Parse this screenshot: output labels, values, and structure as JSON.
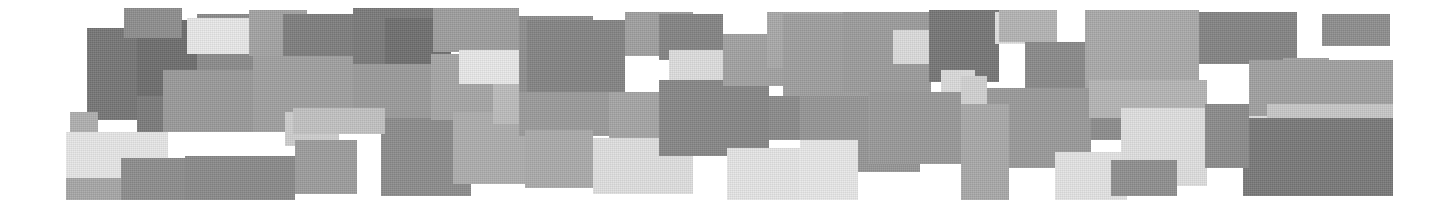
{
  "image": {
    "title": "Abstract grayscale rectangle mosaic",
    "width": 1452,
    "height": 208,
    "background_color": "#ffffff",
    "description": "Horizontal band of overlapping axis-aligned rectangles in shades of gray on a white background, resembling a low-resolution mosaic or pixelated redaction pattern.",
    "palette": {
      "white": "#ffffff",
      "near_white": "#efefef",
      "very_light_gray": "#e3e3e3",
      "light_gray": "#d2d2d2",
      "mid_light_gray": "#bdbdbd",
      "mid_gray": "#a8a8a8",
      "mid_dark_gray": "#969696",
      "dark_gray": "#858585",
      "darker_gray": "#767676",
      "darkest_gray": "#6a6a6a"
    }
  },
  "tiles": [
    {
      "name": "tile-r1-c1-dark",
      "x": 87,
      "y": 28,
      "w": 50,
      "h": 92,
      "color": "#767676"
    },
    {
      "name": "tile-r1-c2-dark",
      "x": 137,
      "y": 20,
      "w": 60,
      "h": 76,
      "color": "#6e6e6e"
    },
    {
      "name": "tile-r1-c3-dark",
      "x": 137,
      "y": 96,
      "w": 60,
      "h": 36,
      "color": "#7b7b7b"
    },
    {
      "name": "tile-r1-c4-mid",
      "x": 197,
      "y": 14,
      "w": 88,
      "h": 56,
      "color": "#8b8b8b"
    },
    {
      "name": "tile-r1-c5-nearwhite",
      "x": 187,
      "y": 18,
      "w": 62,
      "h": 36,
      "color": "#e9e9e9"
    },
    {
      "name": "tile-r1-c6-lightband",
      "x": 249,
      "y": 10,
      "w": 58,
      "h": 46,
      "color": "#a3a3a3"
    },
    {
      "name": "tile-r1-c7-mid",
      "x": 163,
      "y": 70,
      "w": 122,
      "h": 62,
      "color": "#9a9a9a"
    },
    {
      "name": "tile-r1-c8-light",
      "x": 70,
      "y": 112,
      "w": 28,
      "h": 34,
      "color": "#b0b0b0"
    },
    {
      "name": "tile-r1-c9-nearwhite",
      "x": 66,
      "y": 132,
      "w": 102,
      "h": 46,
      "color": "#e7e7e7"
    },
    {
      "name": "tile-r1-c10-midgray",
      "x": 66,
      "y": 178,
      "w": 102,
      "h": 22,
      "color": "#a7a7a7"
    },
    {
      "name": "tile-r1-c11-dark",
      "x": 121,
      "y": 158,
      "w": 66,
      "h": 42,
      "color": "#8d8d8d"
    },
    {
      "name": "tile-r2-c1-dark",
      "x": 124,
      "y": 8,
      "w": 58,
      "h": 30,
      "color": "#8e8e8e"
    },
    {
      "name": "tile-r2-c2-darkmid",
      "x": 283,
      "y": 14,
      "w": 72,
      "h": 62,
      "color": "#7e7e7e"
    },
    {
      "name": "tile-r2-c3-midlight",
      "x": 253,
      "y": 56,
      "w": 100,
      "h": 76,
      "color": "#a0a0a0"
    },
    {
      "name": "tile-r2-c4-light",
      "x": 285,
      "y": 112,
      "w": 54,
      "h": 34,
      "color": "#cfcfcf"
    },
    {
      "name": "tile-r2-c5-darkband",
      "x": 185,
      "y": 156,
      "w": 110,
      "h": 44,
      "color": "#8a8a8a"
    },
    {
      "name": "tile-r2-c6-midgray",
      "x": 295,
      "y": 140,
      "w": 62,
      "h": 54,
      "color": "#9d9d9d"
    },
    {
      "name": "tile-r3-c1-dark",
      "x": 353,
      "y": 8,
      "w": 80,
      "h": 56,
      "color": "#7a7a7a"
    },
    {
      "name": "tile-r3-c2-darker",
      "x": 385,
      "y": 18,
      "w": 66,
      "h": 52,
      "color": "#6f6f6f"
    },
    {
      "name": "tile-r3-c3-mid",
      "x": 353,
      "y": 64,
      "w": 78,
      "h": 56,
      "color": "#9b9b9b"
    },
    {
      "name": "tile-r3-c4-darkblock",
      "x": 381,
      "y": 118,
      "w": 90,
      "h": 78,
      "color": "#8c8c8c"
    },
    {
      "name": "tile-r3-c5-lightband",
      "x": 293,
      "y": 108,
      "w": 92,
      "h": 26,
      "color": "#c2c2c2"
    },
    {
      "name": "tile-r3-c6-midlight",
      "x": 431,
      "y": 54,
      "w": 62,
      "h": 66,
      "color": "#a6a6a6"
    },
    {
      "name": "tile-r4-c1-mid",
      "x": 433,
      "y": 8,
      "w": 86,
      "h": 44,
      "color": "#9e9e9e"
    },
    {
      "name": "tile-r4-c2-nearwhite",
      "x": 459,
      "y": 50,
      "w": 62,
      "h": 34,
      "color": "#e9e9e9"
    },
    {
      "name": "tile-r4-c3-midlight",
      "x": 453,
      "y": 112,
      "w": 74,
      "h": 72,
      "color": "#aeaeae"
    },
    {
      "name": "tile-r4-c4-light",
      "x": 493,
      "y": 84,
      "w": 44,
      "h": 40,
      "color": "#bcbcbc"
    },
    {
      "name": "tile-r5-c1-mid",
      "x": 519,
      "y": 16,
      "w": 74,
      "h": 76,
      "color": "#8f8f8f"
    },
    {
      "name": "tile-r5-c2-darkwide",
      "x": 527,
      "y": 20,
      "w": 98,
      "h": 76,
      "color": "#848484"
    },
    {
      "name": "tile-r5-c3-midband",
      "x": 519,
      "y": 92,
      "w": 118,
      "h": 44,
      "color": "#9b9b9b"
    },
    {
      "name": "tile-r5-c4-midlight",
      "x": 525,
      "y": 130,
      "w": 68,
      "h": 58,
      "color": "#ababab"
    },
    {
      "name": "tile-r5-c5-nearwhite",
      "x": 593,
      "y": 138,
      "w": 100,
      "h": 56,
      "color": "#e0e0e0"
    },
    {
      "name": "tile-r5-c6-midlight2",
      "x": 609,
      "y": 92,
      "w": 56,
      "h": 46,
      "color": "#a5a5a5"
    },
    {
      "name": "tile-r6-c1-midlight",
      "x": 625,
      "y": 12,
      "w": 68,
      "h": 44,
      "color": "#a0a0a0"
    },
    {
      "name": "tile-r6-c2-darkblock",
      "x": 659,
      "y": 14,
      "w": 64,
      "h": 46,
      "color": "#848484"
    },
    {
      "name": "tile-r6-c3-light",
      "x": 669,
      "y": 50,
      "w": 58,
      "h": 34,
      "color": "#dedede"
    },
    {
      "name": "tile-r6-c4-dark",
      "x": 659,
      "y": 80,
      "w": 110,
      "h": 76,
      "color": "#878787"
    },
    {
      "name": "tile-r6-c5-nearwhite",
      "x": 727,
      "y": 148,
      "w": 118,
      "h": 52,
      "color": "#e6e6e6"
    },
    {
      "name": "tile-r6-c6-midgray",
      "x": 723,
      "y": 34,
      "w": 60,
      "h": 52,
      "color": "#a2a2a2"
    },
    {
      "name": "tile-r7-c1-midlight",
      "x": 767,
      "y": 12,
      "w": 78,
      "h": 56,
      "color": "#a9a9a9"
    },
    {
      "name": "tile-r7-c2-midlight2",
      "x": 783,
      "y": 14,
      "w": 92,
      "h": 84,
      "color": "#9f9f9f"
    },
    {
      "name": "tile-r7-c3-dark",
      "x": 769,
      "y": 96,
      "w": 74,
      "h": 44,
      "color": "#8b8b8b"
    },
    {
      "name": "tile-r7-c4-midwide",
      "x": 800,
      "y": 96,
      "w": 120,
      "h": 76,
      "color": "#969696"
    },
    {
      "name": "tile-r7-c5-nearwhite",
      "x": 800,
      "y": 140,
      "w": 58,
      "h": 60,
      "color": "#e8e8e8"
    },
    {
      "name": "tile-r8-c1-mid",
      "x": 843,
      "y": 12,
      "w": 88,
      "h": 80,
      "color": "#9c9c9c"
    },
    {
      "name": "tile-r8-c2-light",
      "x": 893,
      "y": 30,
      "w": 62,
      "h": 34,
      "color": "#dcdcdc"
    },
    {
      "name": "tile-r8-c3-darker",
      "x": 929,
      "y": 10,
      "w": 70,
      "h": 72,
      "color": "#767676"
    },
    {
      "name": "tile-r8-c4-light2",
      "x": 941,
      "y": 70,
      "w": 34,
      "h": 34,
      "color": "#dbdbdb"
    },
    {
      "name": "tile-r8-c5-midwide",
      "x": 869,
      "y": 92,
      "w": 96,
      "h": 72,
      "color": "#999999"
    },
    {
      "name": "tile-r9-c1-nearwhite",
      "x": 995,
      "y": 12,
      "w": 62,
      "h": 32,
      "color": "#e2e2e2"
    },
    {
      "name": "tile-r9-c2-mid",
      "x": 999,
      "y": 10,
      "w": 58,
      "h": 32,
      "color": "#b4b4b4"
    },
    {
      "name": "tile-r9-c3-darkmid",
      "x": 1025,
      "y": 42,
      "w": 62,
      "h": 48,
      "color": "#8a8a8a"
    },
    {
      "name": "tile-r9-c4-midlight",
      "x": 1085,
      "y": 10,
      "w": 62,
      "h": 80,
      "color": "#a8a8a8"
    },
    {
      "name": "tile-r9-c5-midgray",
      "x": 961,
      "y": 88,
      "w": 130,
      "h": 80,
      "color": "#9a9a9a"
    },
    {
      "name": "tile-r9-c6-lightleft",
      "x": 961,
      "y": 76,
      "w": 26,
      "h": 50,
      "color": "#d2d2d2"
    },
    {
      "name": "tile-r9-c7-midband",
      "x": 961,
      "y": 104,
      "w": 48,
      "h": 96,
      "color": "#a9a9a9"
    },
    {
      "name": "tile-r10-c1-dark",
      "x": 1091,
      "y": 86,
      "w": 72,
      "h": 54,
      "color": "#8d8d8d"
    },
    {
      "name": "tile-r10-c2-nearwhite",
      "x": 1055,
      "y": 152,
      "w": 72,
      "h": 48,
      "color": "#e4e4e4"
    },
    {
      "name": "tile-r10-c3-light",
      "x": 1147,
      "y": 150,
      "w": 60,
      "h": 36,
      "color": "#dfdfdf"
    },
    {
      "name": "tile-r11-c1-midlight",
      "x": 1089,
      "y": 10,
      "w": 110,
      "h": 70,
      "color": "#aaaaaa"
    },
    {
      "name": "tile-r11-c2-dark",
      "x": 1199,
      "y": 12,
      "w": 98,
      "h": 52,
      "color": "#848484"
    },
    {
      "name": "tile-r11-c3-isolated",
      "x": 1322,
      "y": 14,
      "w": 68,
      "h": 32,
      "color": "#8e8e8e"
    },
    {
      "name": "tile-r11-c4-light",
      "x": 1089,
      "y": 80,
      "w": 118,
      "h": 38,
      "color": "#b6b6b6"
    },
    {
      "name": "tile-r11-c5-verylight",
      "x": 1121,
      "y": 108,
      "w": 146,
      "h": 60,
      "color": "#e0e0e0"
    },
    {
      "name": "tile-r11-c6-lightnarrow",
      "x": 1257,
      "y": 60,
      "w": 26,
      "h": 52,
      "color": "#d5d5d5"
    },
    {
      "name": "tile-r11-c7-darksmall",
      "x": 1111,
      "y": 160,
      "w": 66,
      "h": 36,
      "color": "#8f8f8f"
    },
    {
      "name": "tile-r12-c1-mid",
      "x": 1283,
      "y": 58,
      "w": 46,
      "h": 56,
      "color": "#a4a4a4"
    },
    {
      "name": "tile-r12-c2-midwide",
      "x": 1249,
      "y": 60,
      "w": 144,
      "h": 56,
      "color": "#a1a1a1"
    },
    {
      "name": "tile-r12-c3-light",
      "x": 1267,
      "y": 104,
      "w": 126,
      "h": 18,
      "color": "#c8c8c8"
    },
    {
      "name": "tile-r12-c4-darkblock",
      "x": 1243,
      "y": 118,
      "w": 150,
      "h": 78,
      "color": "#797979"
    },
    {
      "name": "tile-r12-c5-darkedge",
      "x": 1205,
      "y": 104,
      "w": 44,
      "h": 64,
      "color": "#8b8b8b"
    }
  ]
}
